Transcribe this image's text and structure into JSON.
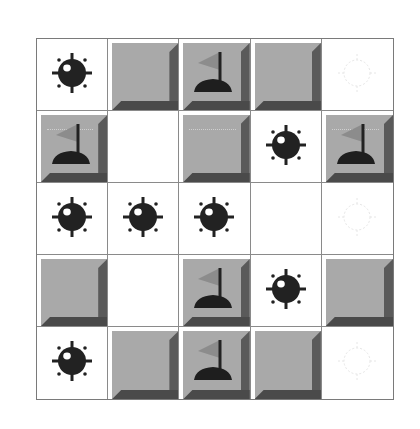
{
  "game": {
    "name": "minesweeper-board",
    "rows": 5,
    "cols": 5,
    "colors": {
      "covered_face": "#a9a9a9",
      "bevel_dark": "#4a4a4a",
      "grid_line": "#8a8a8a",
      "mine": "#222222",
      "flag": "#8a8a8a"
    },
    "cells": [
      [
        "mine",
        "covered",
        "flag",
        "covered",
        "ghost-mine"
      ],
      [
        "flag",
        "empty",
        "covered",
        "mine",
        "flag"
      ],
      [
        "mine",
        "mine",
        "mine",
        "empty",
        "ghost-mine"
      ],
      [
        "covered",
        "empty",
        "flag",
        "mine",
        "covered"
      ],
      [
        "mine",
        "covered",
        "flag",
        "covered",
        "ghost-mine"
      ]
    ]
  }
}
